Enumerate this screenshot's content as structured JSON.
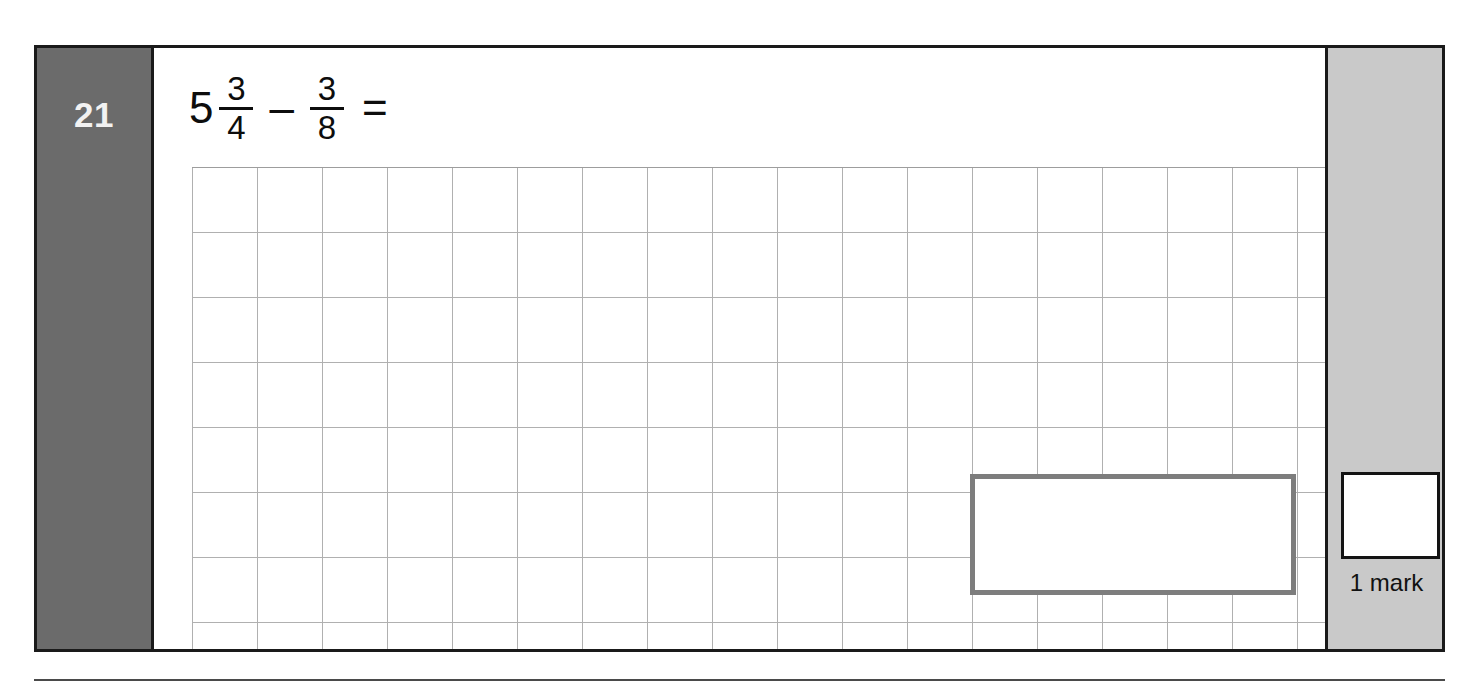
{
  "question": {
    "number": "21",
    "expression": {
      "whole_number": "5",
      "first_fraction": {
        "numerator": "3",
        "denominator": "4"
      },
      "operator": "–",
      "second_fraction": {
        "numerator": "3",
        "denominator": "8"
      },
      "equals": "="
    },
    "answer_value": ""
  },
  "marks": {
    "label": "1 mark",
    "score_value": ""
  },
  "grid": {
    "columns": 18,
    "rows": 8,
    "cell_size_px": 65
  },
  "colors": {
    "number_box_background": "#6b6b6b",
    "number_text": "#f2f2f2",
    "marks_column_background": "#c9c9c9",
    "frame_border": "#1a1a1a",
    "grid_line": "#9a9a9a",
    "answer_box_border": "#7d7d7d",
    "page_background": "#ffffff"
  }
}
